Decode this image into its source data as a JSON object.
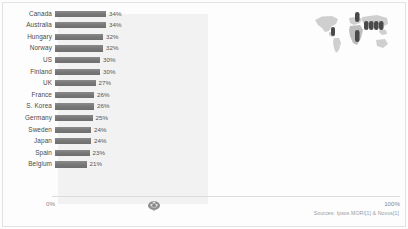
{
  "chart_data": {
    "type": "bar",
    "orientation": "horizontal",
    "title": "",
    "xlabel": "",
    "ylabel": "",
    "xlim": [
      0,
      100
    ],
    "grid": false,
    "legend": null,
    "axis_ticks": [
      "0%",
      "100%"
    ],
    "categories": [
      "Canada",
      "Australia",
      "Hungary",
      "Norway",
      "US",
      "Finland",
      "UK",
      "France",
      "S. Korea",
      "Germany",
      "Sweden",
      "Japan",
      "Spain",
      "Belgium"
    ],
    "values": [
      34,
      34,
      32,
      32,
      30,
      30,
      27,
      26,
      26,
      25,
      24,
      24,
      23,
      21
    ],
    "value_labels": [
      "34%",
      "34%",
      "32%",
      "32%",
      "30%",
      "30%",
      "27%",
      "26%",
      "26%",
      "25%",
      "24%",
      "24%",
      "23%",
      "21%"
    ],
    "bar_color": "#7b7b7b",
    "plot_background": "#f2f2f2"
  },
  "axis": {
    "min_label": "0%",
    "max_label": "100%"
  },
  "graphics": {
    "map_name": "world-map-graphic",
    "watermark_name": "brand-watermark-logo",
    "map_land_color": "#c9c9c9",
    "map_marker_color": "#4f4f4f"
  },
  "footer": {
    "source": "Sources: Ipsos MORI[1] & Novus[1]"
  }
}
